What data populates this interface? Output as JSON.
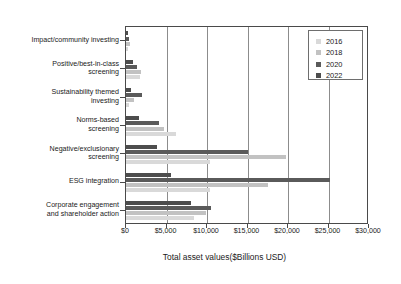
{
  "chart_data": {
    "type": "bar",
    "orientation": "horizontal",
    "title": "",
    "xlabel": "Total asset values($Billions USD)",
    "ylabel": "",
    "xlim": [
      0,
      30000
    ],
    "xticks": [
      0,
      5000,
      10000,
      15000,
      20000,
      25000,
      30000
    ],
    "xticklabels": [
      "$0",
      "$5,000",
      "$10,000",
      "$15,000",
      "$20,000",
      "$25,000",
      "$30,000"
    ],
    "grid": true,
    "grid_axis": "x",
    "legend_position": "upper right",
    "categories": [
      "Impact/community investing",
      "Positive/best-in-class\nscreening",
      "Sustainability themed\ninvesting",
      "Norms-based\nscreening",
      "Negative/exclusionary\nscreening",
      "ESG integration",
      "Corporate engagement\nand shareholder action"
    ],
    "series": [
      {
        "name": "2016",
        "color": "#d9d9d9",
        "values": [
          250,
          1760,
          330,
          6210,
          10380,
          10350,
          8380
        ]
      },
      {
        "name": "2018",
        "color": "#c2c2c2",
        "values": [
          440,
          1840,
          1020,
          4680,
          19770,
          17540,
          9830
        ]
      },
      {
        "name": "2020",
        "color": "#5a5a5a",
        "values": [
          352,
          1384,
          1948,
          4018,
          15030,
          25195,
          10504
        ]
      },
      {
        "name": "2022",
        "color": "#4d4d4d",
        "values": [
          275,
          835,
          572,
          1550,
          3840,
          5590,
          7990
        ]
      }
    ],
    "series_draw_order_top_to_bottom": [
      "2022",
      "2020",
      "2018",
      "2016"
    ]
  },
  "legend": {
    "items": [
      {
        "label": "2016",
        "color": "#d9d9d9"
      },
      {
        "label": "2018",
        "color": "#c2c2c2"
      },
      {
        "label": "2020",
        "color": "#5a5a5a"
      },
      {
        "label": "2022",
        "color": "#4d4d4d"
      }
    ]
  },
  "axis": {
    "x_title": "Total asset values($Billions USD)"
  }
}
